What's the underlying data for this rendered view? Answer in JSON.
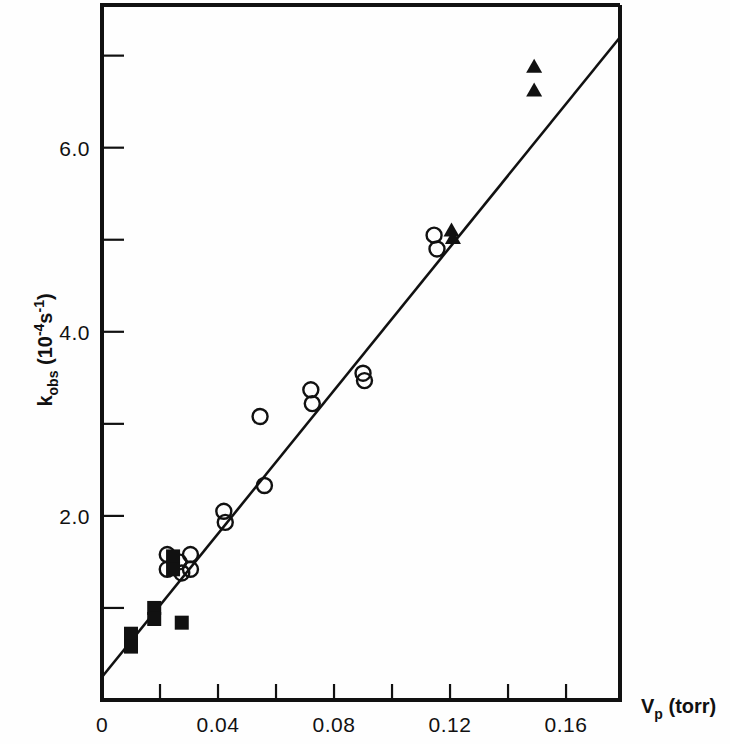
{
  "figure": {
    "background_color": "#fefefe",
    "ink_color": "#111111"
  },
  "axes": {
    "x_title_main": "V",
    "x_title_sub": "p",
    "x_title_unit": "(torr)",
    "y_title_main": "k",
    "y_title_sub": "obs",
    "y_title_unit_open": "(10",
    "y_title_unit_exp1": "-4",
    "y_title_unit_s": "s",
    "y_title_unit_exp2": "-1",
    "y_title_unit_close": ")"
  },
  "chart_data": {
    "type": "scatter",
    "title": "",
    "xlabel": "V_p (torr)",
    "ylabel": "k_obs (10^-4 s^-1)",
    "xlim": [
      0,
      0.1786
    ],
    "ylim": [
      0,
      7.55
    ],
    "grid": false,
    "legend_position": "none",
    "x_ticks_major": [
      0,
      0.04,
      0.08,
      0.12,
      0.16
    ],
    "x_tick_labels": [
      "0",
      "0.04",
      "0.08",
      "0.12",
      "0.16"
    ],
    "x_ticks_minor": [
      0.02,
      0.06,
      0.1,
      0.14
    ],
    "y_ticks_major": [
      2.0,
      4.0,
      6.0
    ],
    "y_tick_labels": [
      "2.0",
      "4.0",
      "6.0"
    ],
    "y_ticks_minor": [
      1.0,
      3.0,
      5.0,
      7.0
    ],
    "fit_line": {
      "label": "linear fit",
      "x_start": 0.0,
      "y_start": 0.25,
      "x_end": 0.1786,
      "y_end": 7.2,
      "slope": 38.9,
      "intercept": 0.25
    },
    "series": [
      {
        "name": "open circles",
        "marker": "open-circle",
        "points": [
          [
            0.0225,
            1.58
          ],
          [
            0.0225,
            1.42
          ],
          [
            0.0265,
            1.5
          ],
          [
            0.0275,
            1.38
          ],
          [
            0.0305,
            1.58
          ],
          [
            0.0305,
            1.42
          ],
          [
            0.042,
            2.05
          ],
          [
            0.0425,
            1.93
          ],
          [
            0.0545,
            3.08
          ],
          [
            0.056,
            2.33
          ],
          [
            0.072,
            3.37
          ],
          [
            0.0725,
            3.22
          ],
          [
            0.09,
            3.55
          ],
          [
            0.0905,
            3.47
          ],
          [
            0.1145,
            5.05
          ],
          [
            0.1155,
            4.9
          ]
        ]
      },
      {
        "name": "filled squares",
        "marker": "filled-square",
        "points": [
          [
            0.01,
            0.72
          ],
          [
            0.01,
            0.58
          ],
          [
            0.018,
            1.0
          ],
          [
            0.018,
            0.88
          ],
          [
            0.0245,
            1.56
          ],
          [
            0.0245,
            1.42
          ],
          [
            0.0275,
            0.84
          ]
        ]
      },
      {
        "name": "filled triangles",
        "marker": "filled-triangle",
        "points": [
          [
            0.1205,
            5.1
          ],
          [
            0.121,
            5.02
          ],
          [
            0.149,
            6.88
          ],
          [
            0.149,
            6.62
          ]
        ]
      }
    ]
  }
}
